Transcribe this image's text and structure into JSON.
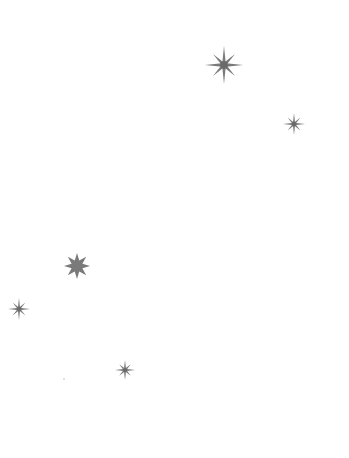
{
  "canvas": {
    "width": 349,
    "height": 458,
    "background": "#ffffff"
  },
  "colors": {
    "star": "#7a7a7a",
    "star_core": "#6a6a6a",
    "speck": "#b8b8b8"
  },
  "stars": [
    {
      "id": "star-1",
      "icon": "asterisk-star-icon",
      "style": "spoke",
      "cx": 224,
      "cy": 65,
      "r": 19,
      "points": 8
    },
    {
      "id": "star-2",
      "icon": "asterisk-star-icon",
      "style": "spoke",
      "cx": 294,
      "cy": 124,
      "r": 11,
      "points": 8
    },
    {
      "id": "star-3",
      "icon": "filled-star-icon",
      "style": "filled",
      "cx": 77,
      "cy": 266,
      "r": 13,
      "points": 8
    },
    {
      "id": "star-4",
      "icon": "asterisk-star-icon",
      "style": "spoke",
      "cx": 19,
      "cy": 309,
      "r": 11,
      "points": 8
    },
    {
      "id": "star-5",
      "icon": "asterisk-star-icon",
      "style": "spoke",
      "cx": 125,
      "cy": 370,
      "r": 10,
      "points": 8
    }
  ],
  "specks": [
    {
      "cx": 64,
      "cy": 379,
      "r": 0.8
    }
  ]
}
